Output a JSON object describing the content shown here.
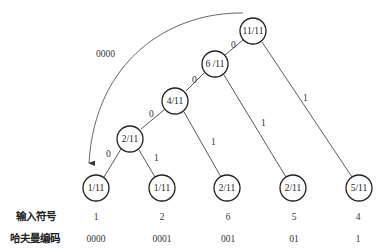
{
  "nodes": {
    "root": "11/11",
    "n6": "6 /11",
    "n4": "4/11",
    "n2": "2/11",
    "leaves": [
      "1/11",
      "1/11",
      "2/11",
      "2/11",
      "5/11"
    ]
  },
  "edge_labels": {
    "root_left": "0",
    "root_right": "1",
    "n6_left": "0",
    "n6_right": "1",
    "n4_left": "0",
    "n4_right": "1",
    "n2_left": "0",
    "n2_right": "1"
  },
  "arc_label": "0000",
  "table": {
    "row1_label": "输入符号",
    "row2_label": "哈夫曼编码",
    "symbols": [
      "1",
      "2",
      "6",
      "5",
      "4"
    ],
    "codes": [
      "0000",
      "0001",
      "001",
      "01",
      "1"
    ]
  }
}
